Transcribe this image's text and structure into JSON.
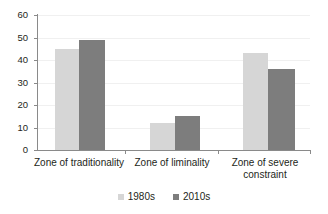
{
  "chart_data": {
    "type": "bar",
    "title": "",
    "subtitle": "",
    "xlabel": "",
    "ylabel": "",
    "categories": [
      "Zone of traditionality",
      "Zone of liminality",
      "Zone of severe constraint"
    ],
    "series": [
      {
        "name": "1980s",
        "color": "#d6d6d6",
        "values": [
          45,
          12,
          43
        ]
      },
      {
        "name": "2010s",
        "color": "#7d7d7d",
        "values": [
          49,
          15,
          36
        ]
      }
    ],
    "ylim": [
      0,
      60
    ],
    "yticks": [
      0,
      10,
      20,
      30,
      40,
      50,
      60
    ],
    "ytick_labels": [
      "0",
      "10",
      "20",
      "30",
      "40",
      "50",
      "60"
    ],
    "grid": true,
    "grid_axis": "y",
    "legend": {
      "position": "bottom",
      "entries": [
        {
          "label": "1980s",
          "color": "#d6d6d6"
        },
        {
          "label": "2010s",
          "color": "#7d7d7d"
        }
      ]
    },
    "annotations": []
  },
  "axis": {
    "y": {
      "labels": [
        "60",
        "50",
        "40",
        "30",
        "20",
        "10",
        "0"
      ]
    }
  },
  "categories": [
    {
      "line1": "Zone of traditionality",
      "line2": ""
    },
    {
      "line1": "Zone of liminality",
      "line2": ""
    },
    {
      "line1": "Zone of severe",
      "line2": "constraint"
    }
  ],
  "legend": {
    "items": [
      {
        "label": "1980s"
      },
      {
        "label": "2010s"
      }
    ]
  },
  "colors": {
    "series_1980s": "#d6d6d6",
    "series_2010s": "#7d7d7d",
    "axis": "#8a8a8a",
    "grid": "#f0f0f0",
    "text": "#231f20",
    "background": "#ffffff"
  }
}
